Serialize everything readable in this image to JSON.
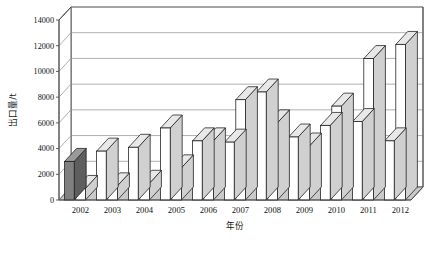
{
  "chart_data": {
    "type": "bar",
    "title": "",
    "subtitle": "",
    "xlabel": "年份",
    "ylabel": "出口量/t",
    "categories": [
      "2002",
      "2003",
      "2004",
      "2005",
      "2006",
      "2007",
      "2008",
      "2009",
      "2010",
      "2011",
      "2012"
    ],
    "series": [
      {
        "name": "series-1",
        "values": [
          3000,
          3800,
          4100,
          5600,
          4600,
          4500,
          8400,
          4900,
          5800,
          6100,
          4600
        ]
      },
      {
        "name": "series-2",
        "values": [
          900,
          1100,
          1300,
          2500,
          4600,
          7800,
          6000,
          4200,
          7300,
          11000,
          12100
        ]
      }
    ],
    "highlighted": {
      "series": 0,
      "category": "2002",
      "fill": "#808080"
    },
    "ylim": [
      0,
      14000
    ],
    "ytick_step": 2000,
    "yticks": [
      "0",
      "2000",
      "4000",
      "6000",
      "8000",
      "10000",
      "12000",
      "14000"
    ],
    "grid": true,
    "legend": "none",
    "style": "3d-column",
    "colors": {
      "bar_fill": "#ffffff",
      "bar_highlight_fill": "#808080",
      "bar_top_fill": "#e8e8e8",
      "bar_side_fill": "#d0d0d0",
      "bar_highlight_side": "#5e5e5e",
      "bar_outline": "#1a1a1a",
      "grid": "#8c8c8c",
      "axis": "#4d4d4d",
      "floor": "#c9c9c9",
      "plot_bg": "#ffffff",
      "page_bg": "#ffffff",
      "text": "#111111"
    }
  }
}
